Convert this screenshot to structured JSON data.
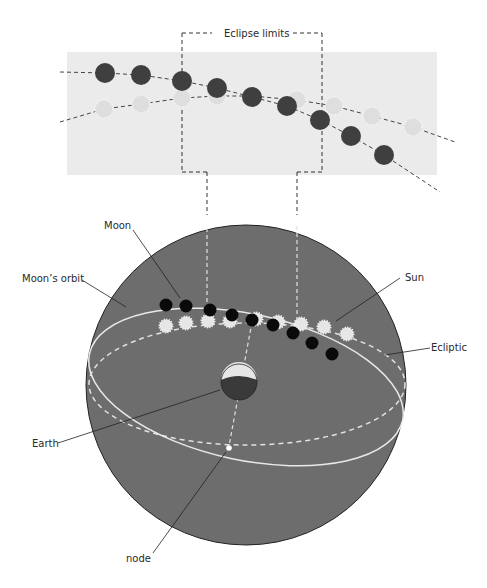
{
  "labels": {
    "eclipse_limits": "Eclipse limits",
    "moon": "Moon",
    "moons_orbit": "Moon’s orbit",
    "sun": "Sun",
    "ecliptic": "Ecliptic",
    "earth": "Earth",
    "node": "node"
  },
  "colors": {
    "panel_bg": "#ebebeb",
    "sphere_fill": "#6d6d6d",
    "moon_dark_panel": "#3f3f3f",
    "moon_dark_sphere": "#0a0a0a",
    "sun_light": "#e3e3e3",
    "orbit_line": "#e8e8e8"
  },
  "top_panel": {
    "moon_positions": [
      [
        105,
        73
      ],
      [
        141,
        75
      ],
      [
        182,
        81
      ],
      [
        217,
        88
      ],
      [
        252,
        97
      ],
      [
        287,
        106
      ],
      [
        320,
        120
      ],
      [
        351,
        136
      ],
      [
        384,
        155
      ]
    ],
    "sun_positions": [
      [
        104,
        109
      ],
      [
        141,
        104
      ],
      [
        182,
        98
      ],
      [
        217,
        96
      ],
      [
        297,
        100
      ],
      [
        334,
        106
      ],
      [
        372,
        116
      ],
      [
        413,
        127
      ]
    ]
  },
  "sphere": {
    "moon_positions": [
      [
        166,
        305
      ],
      [
        186,
        306
      ],
      [
        210,
        310
      ],
      [
        232,
        315
      ],
      [
        252,
        320
      ],
      [
        273,
        325
      ],
      [
        293,
        333
      ],
      [
        312,
        343
      ],
      [
        332,
        354
      ]
    ],
    "sun_positions": [
      [
        166,
        326
      ],
      [
        186,
        323
      ],
      [
        208,
        321
      ],
      [
        230,
        321
      ],
      [
        256,
        319
      ],
      [
        278,
        322
      ],
      [
        301,
        324
      ],
      [
        324,
        327
      ],
      [
        347,
        334
      ]
    ]
  }
}
